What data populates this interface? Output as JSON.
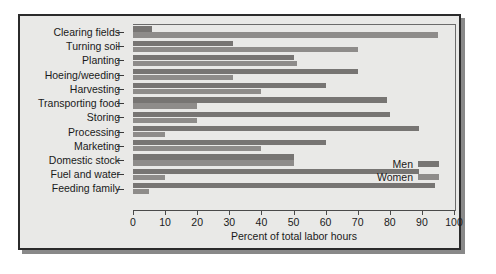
{
  "chart_data": {
    "type": "bar",
    "orientation": "horizontal",
    "title": "",
    "xlabel": "Percent of total labor hours",
    "ylabel": "",
    "xlim": [
      0,
      100
    ],
    "xticks": [
      0,
      10,
      20,
      30,
      40,
      50,
      60,
      70,
      80,
      90,
      100
    ],
    "grid": false,
    "legend_position": "middle-right",
    "categories": [
      "Clearing fields",
      "Turning soil",
      "Planting",
      "Hoeing/weeding",
      "Harvesting",
      "Transporting food",
      "Storing",
      "Processing",
      "Marketing",
      "Domestic stock",
      "Fuel and water",
      "Feeding family"
    ],
    "series": [
      {
        "name": "Men",
        "color": "#777573",
        "values": [
          6,
          31,
          50,
          70,
          60,
          79,
          80,
          89,
          60,
          50,
          89,
          94
        ]
      },
      {
        "name": "Women",
        "color": "#8e8c8a",
        "values": [
          95,
          70,
          51,
          31,
          40,
          20,
          20,
          10,
          40,
          50,
          10,
          5
        ]
      }
    ]
  },
  "legend": {
    "items": [
      {
        "label": "Men",
        "swatch": "men-swatch"
      },
      {
        "label": "Women",
        "swatch": "women-swatch"
      }
    ]
  }
}
